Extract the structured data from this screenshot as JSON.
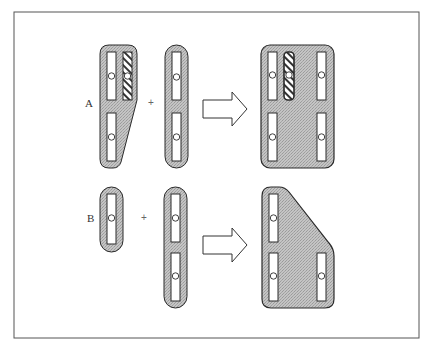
{
  "figure": {
    "frame": {
      "x": 14,
      "y": 12,
      "width": 405,
      "height": 326
    },
    "colors": {
      "plate_fill": "#bdbdbd",
      "plate_stroke": "#2a2a2a",
      "slot_fill": "#ffffff",
      "frame_stroke": "#555555",
      "arrow_stroke": "#333333",
      "hatch": "#333333"
    },
    "rows": [
      {
        "label": "A",
        "operator": "+",
        "label_pos": {
          "x": 85,
          "y": 98
        },
        "operator_pos": {
          "x": 148,
          "y": 98
        },
        "part1": "tapered plate with two upper slots (one hatched) and one lower slot",
        "part2": "long rounded bar with two slots",
        "result": "rounded rectangle plate with five slots (one hatched)"
      },
      {
        "label": "B",
        "operator": "+",
        "label_pos": {
          "x": 87,
          "y": 213
        },
        "operator_pos": {
          "x": 141,
          "y": 213
        },
        "part1": "short rounded bar with one slot",
        "part2": "long rounded bar with two slots",
        "result": "chamfered plate with three slots"
      }
    ],
    "arrows": [
      {
        "direction": "right",
        "row": "A"
      },
      {
        "direction": "right",
        "row": "B"
      }
    ]
  }
}
